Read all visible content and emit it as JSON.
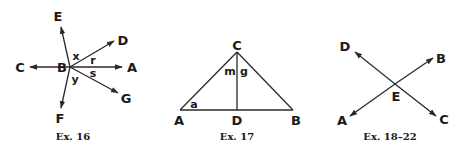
{
  "figures": [
    {
      "caption": "Ex. 16",
      "vertex": "B",
      "rays": [
        "A",
        "C",
        "D",
        "E",
        "F",
        "G"
      ],
      "angle_labels": [
        "x",
        "r",
        "s",
        "y"
      ]
    },
    {
      "caption": "Ex. 17",
      "vertices": [
        "A",
        "B",
        "C",
        "D"
      ],
      "segments": [
        "AB",
        "AC",
        "BC",
        "CD"
      ],
      "angle_labels": [
        "m",
        "g",
        "a"
      ]
    },
    {
      "caption": "Ex. 18–22",
      "intersection": "E",
      "rays": [
        "A",
        "B",
        "C",
        "D"
      ]
    }
  ],
  "labels": {
    "f16": {
      "E": "E",
      "D": "D",
      "C": "C",
      "B": "B",
      "A": "A",
      "G": "G",
      "F": "F",
      "x": "x",
      "r": "r",
      "s": "s",
      "y": "y"
    },
    "f17": {
      "C": "C",
      "A": "A",
      "D": "D",
      "B": "B",
      "m": "m",
      "g": "g",
      "a": "a"
    },
    "f18": {
      "D": "D",
      "B": "B",
      "E": "E",
      "A": "A",
      "C": "C"
    }
  },
  "colors": {
    "ink": "#1a1a1a",
    "background": "#ffffff"
  }
}
